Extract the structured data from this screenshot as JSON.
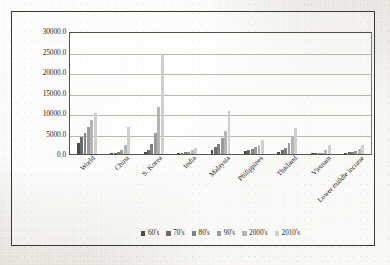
{
  "chart_data": {
    "type": "bar",
    "title": "",
    "xlabel": "",
    "ylabel": "",
    "ylim": [
      0,
      30000
    ],
    "grid": true,
    "legend_position": "bottom",
    "categories": [
      "World",
      "China",
      "S. Korea",
      "India",
      "Malaysia",
      "Philippines",
      "Thailand",
      "Vietnam",
      "Lower middle income"
    ],
    "ytick_labels": [
      "30000.0",
      "25000.0",
      "20000.0",
      "15000.0",
      "10000.0",
      "5000.0",
      "0.0"
    ],
    "ytick_values": [
      30000,
      25000,
      20000,
      15000,
      10000,
      5000,
      0
    ],
    "series": [
      {
        "name": "60's",
        "color": "#4a4a4a",
        "values": [
          2600,
          200,
          400,
          300,
          1100,
          700,
          600,
          150,
          350
        ]
      },
      {
        "name": "70's",
        "color": "#6b6b6b",
        "values": [
          4100,
          300,
          900,
          350,
          1700,
          1000,
          900,
          180,
          450
        ]
      },
      {
        "name": "80's",
        "color": "#828282",
        "values": [
          5200,
          450,
          2400,
          450,
          2500,
          1300,
          1400,
          220,
          600
        ]
      },
      {
        "name": "90's",
        "color": "#9a9a9a",
        "values": [
          6700,
          900,
          5200,
          550,
          3900,
          1600,
          2700,
          350,
          800
        ]
      },
      {
        "name": "2000's",
        "color": "#b5b5b5",
        "values": [
          8400,
          2200,
          11500,
          900,
          5600,
          2100,
          4100,
          900,
          1300
        ]
      },
      {
        "name": "2010's",
        "color": "#cfcfcf",
        "values": [
          10000,
          6500,
          24500,
          1500,
          10500,
          3300,
          6300,
          2100,
          2200
        ]
      }
    ]
  }
}
